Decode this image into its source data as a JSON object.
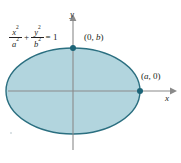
{
  "figure": {
    "type": "ellipse-diagram",
    "background_color": "#ffffff",
    "width": 181,
    "height": 163
  },
  "equation": {
    "numerator_1": "x",
    "numerator_1_exp": "2",
    "denominator_1": "a",
    "denominator_1_exp": "2",
    "operator": "+",
    "numerator_2": "y",
    "numerator_2_exp": "2",
    "denominator_2": "b",
    "denominator_2_exp": "2",
    "equals": "= 1"
  },
  "axes": {
    "x_label": "x",
    "y_label": "y",
    "axis_color": "#8a8a8a",
    "origin": {
      "x": 73,
      "y": 91
    }
  },
  "points": [
    {
      "name": "top-vertex",
      "label_open": "(0, ",
      "label_var": "b",
      "label_close": ")",
      "label_text": "(0, b)",
      "cx": 73,
      "cy": 48,
      "color": "#1c6477"
    },
    {
      "name": "right-vertex",
      "label_open": "(",
      "label_var": "a",
      "label_close": ", 0)",
      "label_text": "(a, 0)",
      "cx": 140,
      "cy": 91,
      "color": "#1c6477"
    }
  ],
  "ellipse": {
    "cx": 73,
    "cy": 91,
    "rx": 67,
    "ry": 43,
    "fill_color": "#b2d5de",
    "stroke_color": "#2b6f80",
    "stroke_width": 1.4
  },
  "colors": {
    "fill": "#b2d5de",
    "stroke": "#2b6f80",
    "axis": "#8a8a8a",
    "text": "#231f20",
    "point": "#1c6477"
  }
}
